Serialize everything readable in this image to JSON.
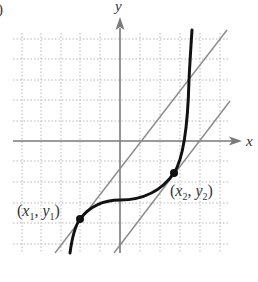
{
  "figure": {
    "panel_label": ")",
    "axes": {
      "x_label": "x",
      "y_label": "y",
      "origin_px": [
        120,
        141
      ],
      "grid_spacing_px": 19.8,
      "grid_extent_px": {
        "left": 13,
        "right": 229,
        "top": 33,
        "bottom": 253
      }
    },
    "points": [
      {
        "name": "p1",
        "label_open": "(",
        "var1": "x",
        "sub1": "1",
        "comma": ", ",
        "var2": "y",
        "sub2": "1",
        "label_close": ")",
        "px": [
          80,
          219
        ]
      },
      {
        "name": "p2",
        "label_open": "(",
        "var1": "x",
        "sub1": "2",
        "comma": ", ",
        "var2": "y",
        "sub2": "2",
        "label_close": ")",
        "px": [
          174,
          173
        ]
      }
    ],
    "curve": {
      "description": "cubic-like increasing curve with inflection near the y-axis",
      "color": "#111111"
    },
    "tangent_lines": {
      "description": "two parallel tangent lines at (x1,y1) and (x2,y2)",
      "color": "#8a8a8a"
    },
    "colors": {
      "grid": "#b8b8b8",
      "axis": "#7a7a7a",
      "curve": "#111111",
      "tangent": "#8a8a8a",
      "text": "#333333"
    }
  }
}
